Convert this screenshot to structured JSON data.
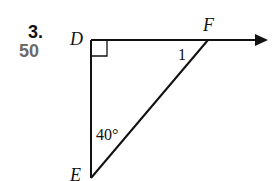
{
  "problem": {
    "number": "3.",
    "points": "50"
  },
  "figure": {
    "vertices": {
      "D": "D",
      "E": "E",
      "F": "F"
    },
    "angle_E": "40°",
    "angle_1": "1",
    "right_angle_at": "D",
    "ray": "DF (arrow pointing right)",
    "colors": {
      "stroke": "#111111",
      "points_text": "#6b6b6b"
    }
  }
}
